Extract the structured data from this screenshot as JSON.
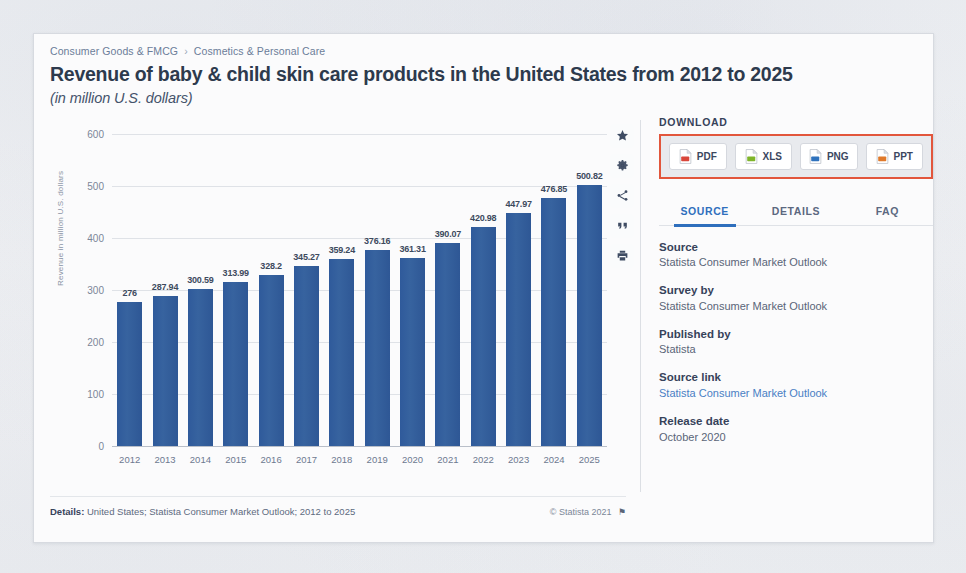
{
  "header": {
    "breadcrumb": [
      "Consumer Goods & FMCG",
      "Cosmetics & Personal Care"
    ],
    "breadcrumb_separator": "›",
    "title": "Revenue of baby & child skin care products in the United States from 2012 to 2025",
    "subtitle": "(in million U.S. dollars)"
  },
  "chart_data": {
    "type": "bar",
    "title": "Revenue of baby & child skin care products in the United States from 2012 to 2025",
    "subtitle": "(in million U.S. dollars)",
    "xlabel": "",
    "ylabel": "Revenue in million U.S. dollars",
    "ylim": [
      0,
      600
    ],
    "yticks": [
      0,
      100,
      200,
      300,
      400,
      500,
      600
    ],
    "grid": true,
    "legend": false,
    "bar_color": "#34609f",
    "categories": [
      "2012",
      "2013",
      "2014",
      "2015",
      "2016",
      "2017",
      "2018",
      "2019",
      "2020",
      "2021",
      "2022",
      "2023",
      "2024",
      "2025"
    ],
    "values": [
      276,
      287.94,
      300.59,
      313.99,
      328.2,
      345.27,
      359.24,
      376.16,
      361.31,
      390.07,
      420.98,
      447.97,
      476.85,
      500.82
    ],
    "value_labels": [
      "276",
      "287.94",
      "300.59",
      "313.99",
      "328.2",
      "345.27",
      "359.24",
      "376.16",
      "361.31",
      "390.07",
      "420.98",
      "447.97",
      "476.85",
      "500.82"
    ]
  },
  "chart_footer": {
    "details_key": "Details:",
    "details_value": "United States; Statista Consumer Market Outlook; 2012 to 2025",
    "copyright": "© Statista 2021",
    "flag": "⚑"
  },
  "rail": [
    {
      "name": "favorite-star-icon",
      "label": "Add to favorites"
    },
    {
      "name": "settings-gear-icon",
      "label": "Settings"
    },
    {
      "name": "share-icon",
      "label": "Share"
    },
    {
      "name": "citation-quote-icon",
      "label": "Cite"
    },
    {
      "name": "print-icon",
      "label": "Print"
    }
  ],
  "download": {
    "label": "DOWNLOAD",
    "highlight_color": "#e2563c",
    "buttons": [
      {
        "label": "PDF",
        "color": "#d9463a"
      },
      {
        "label": "XLS",
        "color": "#7fb52a"
      },
      {
        "label": "PNG",
        "color": "#2f72bd"
      },
      {
        "label": "PPT",
        "color": "#e07a2b"
      }
    ]
  },
  "tabs": [
    {
      "label": "SOURCE",
      "active": true
    },
    {
      "label": "DETAILS",
      "active": false
    },
    {
      "label": "FAQ",
      "active": false
    }
  ],
  "meta": [
    {
      "key": "Source",
      "value": "Statista Consumer Market Outlook",
      "link": false
    },
    {
      "key": "Survey by",
      "value": "Statista Consumer Market Outlook",
      "link": false
    },
    {
      "key": "Published by",
      "value": "Statista",
      "link": false
    },
    {
      "key": "Source link",
      "value": "Statista Consumer Market Outlook",
      "link": true
    },
    {
      "key": "Release date",
      "value": "October 2020",
      "link": false
    }
  ]
}
